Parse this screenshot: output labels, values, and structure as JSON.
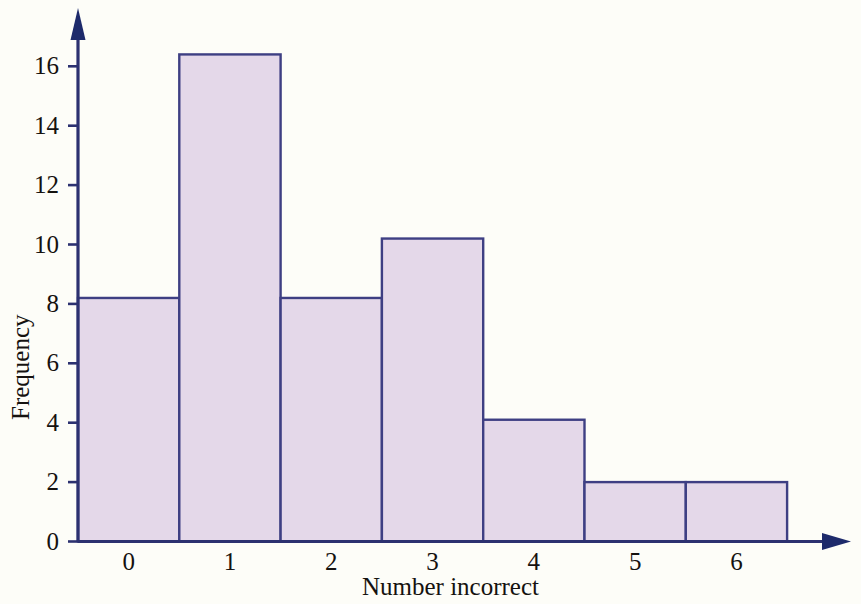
{
  "chart_data": {
    "type": "bar",
    "title": "",
    "subtitle": "",
    "xlabel": "Number incorrect",
    "ylabel": "Frequency",
    "categories": [
      "0",
      "1",
      "2",
      "3",
      "4",
      "5",
      "6"
    ],
    "values": [
      8.2,
      16.4,
      8.2,
      10.2,
      4.1,
      2.0,
      2.0
    ],
    "series": [
      {
        "name": "Frequency",
        "values": [
          8.2,
          16.4,
          8.2,
          10.2,
          4.1,
          2.0,
          2.0
        ]
      }
    ],
    "xtick_labels": [
      "0",
      "1",
      "2",
      "3",
      "4",
      "5",
      "6"
    ],
    "ytick_labels": [
      "0",
      "2",
      "4",
      "6",
      "8",
      "10",
      "12",
      "14",
      "16"
    ],
    "ytick_values": [
      0,
      2,
      4,
      6,
      8,
      10,
      12,
      14,
      16
    ],
    "ylim": [
      0,
      17.6
    ],
    "xlim": [
      -0.5,
      6.5
    ],
    "grid": false,
    "legend": false,
    "legend_position": "none",
    "bar_fill_color": "#e4d8e9",
    "bar_edge_color": "#3e3f83",
    "axis_color": "#2c3170",
    "text_color": "#15120f",
    "background_color": "#fdfdf8",
    "annotations": []
  },
  "icons": {
    "y_axis_arrow": "arrow-up-icon",
    "x_axis_arrow": "arrow-right-icon"
  }
}
